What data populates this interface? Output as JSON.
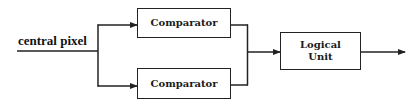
{
  "diagram": {
    "input_label": "central pixel",
    "nodes": [
      {
        "id": "comparator-top",
        "label": "Comparator"
      },
      {
        "id": "comparator-bottom",
        "label": "Comparator"
      },
      {
        "id": "logical-unit",
        "label_line1": "Logical",
        "label_line2": "Unit"
      }
    ],
    "edges": [
      {
        "from": "central pixel",
        "to": "comparator-top"
      },
      {
        "from": "central pixel",
        "to": "comparator-bottom"
      },
      {
        "from": "comparator-top",
        "to": "logical-unit"
      },
      {
        "from": "comparator-bottom",
        "to": "logical-unit"
      },
      {
        "from": "logical-unit",
        "to": "output"
      }
    ],
    "colors": {
      "stroke": "#222222",
      "background": "#ffffff",
      "text": "#111111"
    }
  }
}
